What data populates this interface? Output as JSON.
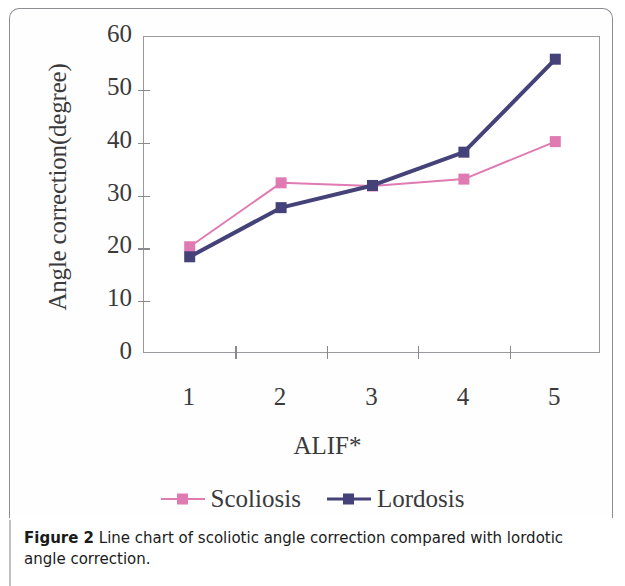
{
  "figure": {
    "caption_prefix": "Figure 2",
    "caption_text": " Line chart of scoliotic angle correction compared with lordotic angle correction."
  },
  "colors": {
    "scoliosis": "#e07ab2",
    "lordosis": "#454279",
    "axis": "#8a8a8e",
    "text": "#3a3a3c"
  },
  "chart_data": {
    "type": "line",
    "title": "",
    "xlabel": "ALIF*",
    "ylabel": "Angle correction(degree)",
    "categories": [
      "1",
      "2",
      "3",
      "4",
      "5"
    ],
    "x_tick_labels": [
      "1",
      "2",
      "3",
      "4",
      "5"
    ],
    "y_tick_labels": [
      "60",
      "50",
      "40",
      "30",
      "20",
      "10",
      "0"
    ],
    "ylim": [
      0,
      60
    ],
    "y_tick_step": 10,
    "grid": false,
    "legend_position": "bottom-center",
    "series": [
      {
        "name": "Scoliosis",
        "color": "#e07ab2",
        "marker": "square",
        "values": [
          20.3,
          32.4,
          31.8,
          33.1,
          40.2
        ]
      },
      {
        "name": "Lordosis",
        "color": "#454279",
        "marker": "square",
        "values": [
          18.4,
          27.7,
          31.9,
          38.2,
          55.8
        ]
      }
    ]
  }
}
